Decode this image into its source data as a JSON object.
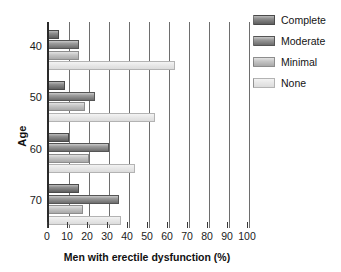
{
  "chart_data": {
    "type": "bar",
    "orientation": "horizontal",
    "title": "",
    "xlabel": "Men with erectile dysfunction (%)",
    "ylabel": "Age",
    "categories": [
      "40",
      "50",
      "60",
      "70"
    ],
    "xlim": [
      0,
      100
    ],
    "xticks": [
      "0",
      "10",
      "20",
      "30",
      "40",
      "50",
      "60",
      "70",
      "80",
      "90",
      "100"
    ],
    "grid": "vertical gridlines at every x tick",
    "legend_position": "top-right",
    "series": [
      {
        "name": "Complete",
        "color": "#5f5f5f",
        "values": [
          5,
          8,
          10,
          15
        ]
      },
      {
        "name": "Moderate",
        "color": "#6d6d6d",
        "values": [
          15,
          23,
          30,
          35
        ]
      },
      {
        "name": "Minimal",
        "color": "#a9a9a9",
        "values": [
          15,
          18,
          20,
          17
        ]
      },
      {
        "name": "None",
        "color": "#dcdcdc",
        "values": [
          63,
          53,
          43,
          36
        ]
      }
    ]
  },
  "legend": {
    "items": [
      {
        "label": "Complete"
      },
      {
        "label": "Moderate"
      },
      {
        "label": "Minimal"
      },
      {
        "label": "None"
      }
    ]
  }
}
